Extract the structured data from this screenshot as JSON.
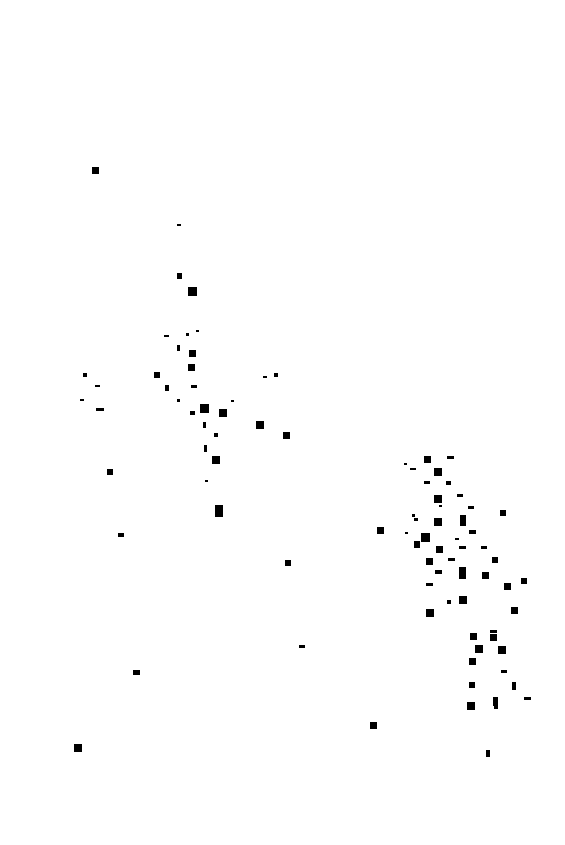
{
  "canvas": {
    "width": 565,
    "height": 845,
    "background_color": "#ffffff"
  },
  "chart_data": {
    "type": "scatter",
    "title": "",
    "subtitle": "",
    "xlabel": "",
    "ylabel": "",
    "grid": false,
    "legend_position": "none",
    "axes_visible": false,
    "tick_labels_x": [],
    "tick_labels_y": [],
    "xlim": [
      0,
      565
    ],
    "ylim": [
      0,
      845
    ],
    "marker": "square",
    "marker_color": "#000000",
    "point_count": 104,
    "series": [
      {
        "name": "points",
        "color": "#000000",
        "points": [
          {
            "x": 92,
            "y": 167,
            "w": 7,
            "h": 7
          },
          {
            "x": 177,
            "y": 224,
            "w": 4,
            "h": 2
          },
          {
            "x": 177,
            "y": 273,
            "w": 5,
            "h": 6
          },
          {
            "x": 188,
            "y": 287,
            "w": 9,
            "h": 9
          },
          {
            "x": 164,
            "y": 335,
            "w": 5,
            "h": 2
          },
          {
            "x": 186,
            "y": 333,
            "w": 3,
            "h": 3
          },
          {
            "x": 177,
            "y": 345,
            "w": 3,
            "h": 6
          },
          {
            "x": 189,
            "y": 350,
            "w": 7,
            "h": 7
          },
          {
            "x": 83,
            "y": 373,
            "w": 4,
            "h": 4
          },
          {
            "x": 154,
            "y": 372,
            "w": 6,
            "h": 6
          },
          {
            "x": 188,
            "y": 364,
            "w": 7,
            "h": 7
          },
          {
            "x": 274,
            "y": 373,
            "w": 4,
            "h": 4
          },
          {
            "x": 95,
            "y": 385,
            "w": 5,
            "h": 2
          },
          {
            "x": 165,
            "y": 385,
            "w": 4,
            "h": 6
          },
          {
            "x": 191,
            "y": 385,
            "w": 6,
            "h": 3
          },
          {
            "x": 80,
            "y": 399,
            "w": 4,
            "h": 2
          },
          {
            "x": 177,
            "y": 399,
            "w": 3,
            "h": 3
          },
          {
            "x": 96,
            "y": 408,
            "w": 8,
            "h": 3
          },
          {
            "x": 200,
            "y": 404,
            "w": 9,
            "h": 9
          },
          {
            "x": 219,
            "y": 409,
            "w": 8,
            "h": 8
          },
          {
            "x": 190,
            "y": 411,
            "w": 5,
            "h": 4
          },
          {
            "x": 256,
            "y": 421,
            "w": 8,
            "h": 8
          },
          {
            "x": 203,
            "y": 422,
            "w": 3,
            "h": 6
          },
          {
            "x": 214,
            "y": 433,
            "w": 4,
            "h": 4
          },
          {
            "x": 283,
            "y": 432,
            "w": 7,
            "h": 7
          },
          {
            "x": 204,
            "y": 445,
            "w": 3,
            "h": 7
          },
          {
            "x": 212,
            "y": 456,
            "w": 8,
            "h": 8
          },
          {
            "x": 107,
            "y": 469,
            "w": 6,
            "h": 6
          },
          {
            "x": 215,
            "y": 505,
            "w": 8,
            "h": 12
          },
          {
            "x": 118,
            "y": 533,
            "w": 6,
            "h": 4
          },
          {
            "x": 285,
            "y": 560,
            "w": 6,
            "h": 6
          },
          {
            "x": 299,
            "y": 645,
            "w": 6,
            "h": 3
          },
          {
            "x": 133,
            "y": 670,
            "w": 7,
            "h": 5
          },
          {
            "x": 74,
            "y": 744,
            "w": 8,
            "h": 8
          },
          {
            "x": 370,
            "y": 722,
            "w": 7,
            "h": 7
          },
          {
            "x": 377,
            "y": 527,
            "w": 7,
            "h": 7
          },
          {
            "x": 412,
            "y": 514,
            "w": 3,
            "h": 3
          },
          {
            "x": 414,
            "y": 518,
            "w": 4,
            "h": 3
          },
          {
            "x": 424,
            "y": 456,
            "w": 7,
            "h": 7
          },
          {
            "x": 447,
            "y": 456,
            "w": 7,
            "h": 3
          },
          {
            "x": 410,
            "y": 468,
            "w": 6,
            "h": 2
          },
          {
            "x": 434,
            "y": 468,
            "w": 8,
            "h": 8
          },
          {
            "x": 424,
            "y": 481,
            "w": 6,
            "h": 3
          },
          {
            "x": 446,
            "y": 481,
            "w": 5,
            "h": 4
          },
          {
            "x": 434,
            "y": 495,
            "w": 8,
            "h": 8
          },
          {
            "x": 457,
            "y": 494,
            "w": 6,
            "h": 3
          },
          {
            "x": 468,
            "y": 506,
            "w": 6,
            "h": 3
          },
          {
            "x": 434,
            "y": 518,
            "w": 8,
            "h": 8
          },
          {
            "x": 460,
            "y": 515,
            "w": 6,
            "h": 11
          },
          {
            "x": 469,
            "y": 530,
            "w": 7,
            "h": 4
          },
          {
            "x": 421,
            "y": 533,
            "w": 9,
            "h": 9
          },
          {
            "x": 414,
            "y": 541,
            "w": 6,
            "h": 7
          },
          {
            "x": 436,
            "y": 546,
            "w": 7,
            "h": 7
          },
          {
            "x": 459,
            "y": 546,
            "w": 7,
            "h": 3
          },
          {
            "x": 481,
            "y": 546,
            "w": 6,
            "h": 3
          },
          {
            "x": 426,
            "y": 558,
            "w": 7,
            "h": 7
          },
          {
            "x": 448,
            "y": 558,
            "w": 7,
            "h": 3
          },
          {
            "x": 492,
            "y": 557,
            "w": 6,
            "h": 6
          },
          {
            "x": 435,
            "y": 570,
            "w": 7,
            "h": 4
          },
          {
            "x": 459,
            "y": 567,
            "w": 7,
            "h": 12
          },
          {
            "x": 482,
            "y": 572,
            "w": 7,
            "h": 7
          },
          {
            "x": 426,
            "y": 583,
            "w": 7,
            "h": 3
          },
          {
            "x": 459,
            "y": 596,
            "w": 8,
            "h": 8
          },
          {
            "x": 504,
            "y": 583,
            "w": 7,
            "h": 7
          },
          {
            "x": 426,
            "y": 609,
            "w": 8,
            "h": 8
          },
          {
            "x": 447,
            "y": 600,
            "w": 4,
            "h": 4
          },
          {
            "x": 511,
            "y": 607,
            "w": 7,
            "h": 7
          },
          {
            "x": 490,
            "y": 630,
            "w": 7,
            "h": 3
          },
          {
            "x": 470,
            "y": 633,
            "w": 7,
            "h": 7
          },
          {
            "x": 490,
            "y": 634,
            "w": 7,
            "h": 7
          },
          {
            "x": 475,
            "y": 645,
            "w": 8,
            "h": 8
          },
          {
            "x": 498,
            "y": 646,
            "w": 8,
            "h": 8
          },
          {
            "x": 469,
            "y": 658,
            "w": 7,
            "h": 7
          },
          {
            "x": 501,
            "y": 670,
            "w": 6,
            "h": 3
          },
          {
            "x": 469,
            "y": 682,
            "w": 6,
            "h": 6
          },
          {
            "x": 512,
            "y": 682,
            "w": 4,
            "h": 8
          },
          {
            "x": 467,
            "y": 702,
            "w": 8,
            "h": 8
          },
          {
            "x": 493,
            "y": 697,
            "w": 5,
            "h": 9
          },
          {
            "x": 524,
            "y": 697,
            "w": 7,
            "h": 3
          },
          {
            "x": 494,
            "y": 705,
            "w": 4,
            "h": 4
          },
          {
            "x": 486,
            "y": 750,
            "w": 4,
            "h": 7
          },
          {
            "x": 404,
            "y": 463,
            "w": 3,
            "h": 2
          },
          {
            "x": 439,
            "y": 505,
            "w": 3,
            "h": 2
          },
          {
            "x": 455,
            "y": 538,
            "w": 4,
            "h": 2
          },
          {
            "x": 405,
            "y": 532,
            "w": 3,
            "h": 2
          },
          {
            "x": 500,
            "y": 510,
            "w": 6,
            "h": 6
          },
          {
            "x": 521,
            "y": 578,
            "w": 6,
            "h": 6
          },
          {
            "x": 196,
            "y": 330,
            "w": 3,
            "h": 2
          },
          {
            "x": 231,
            "y": 400,
            "w": 3,
            "h": 2
          },
          {
            "x": 205,
            "y": 480,
            "w": 3,
            "h": 2
          },
          {
            "x": 263,
            "y": 376,
            "w": 4,
            "h": 2
          }
        ]
      }
    ]
  }
}
